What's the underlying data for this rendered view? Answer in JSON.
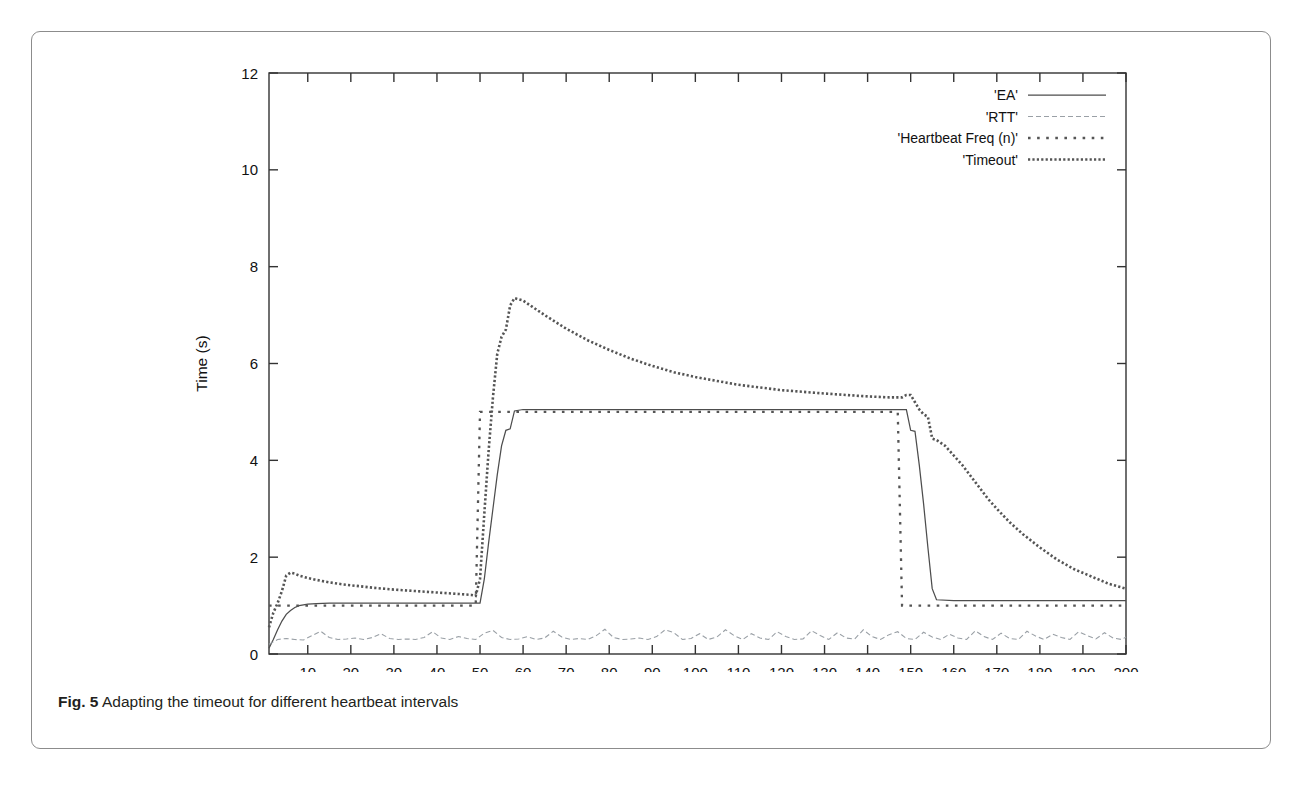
{
  "figure": {
    "caption_label": "Fig. 5",
    "caption_text": "Adapting the timeout for different heartbeat intervals"
  },
  "chart_data": {
    "type": "line",
    "title": "",
    "xlabel": "Message number",
    "ylabel": "Time (s)",
    "xlim": [
      1,
      200
    ],
    "ylim": [
      0,
      12
    ],
    "xticks": [
      10,
      20,
      30,
      40,
      50,
      60,
      70,
      80,
      90,
      100,
      110,
      120,
      130,
      140,
      150,
      160,
      170,
      180,
      190,
      200
    ],
    "yticks": [
      0,
      2,
      4,
      6,
      8,
      10,
      12
    ],
    "grid": false,
    "legend_position": "top-right",
    "series": [
      {
        "name": "'EA'",
        "style": "solid",
        "color": "#4d4d4d",
        "x": [
          1,
          2,
          3,
          4,
          5,
          6,
          7,
          8,
          10,
          12,
          15,
          20,
          25,
          30,
          35,
          40,
          45,
          48,
          49,
          50,
          51,
          52,
          53,
          54,
          55,
          56,
          57,
          58,
          60,
          70,
          80,
          90,
          100,
          110,
          120,
          130,
          140,
          147,
          148,
          149,
          150,
          151,
          152,
          153,
          154,
          155,
          156,
          160,
          170,
          180,
          190,
          200
        ],
        "values": [
          0.12,
          0.3,
          0.5,
          0.68,
          0.82,
          0.9,
          0.96,
          1.0,
          1.03,
          1.04,
          1.05,
          1.05,
          1.05,
          1.05,
          1.05,
          1.05,
          1.05,
          1.05,
          1.05,
          1.05,
          1.55,
          2.3,
          3.0,
          3.7,
          4.3,
          4.62,
          4.65,
          5.02,
          5.05,
          5.05,
          5.05,
          5.05,
          5.05,
          5.05,
          5.05,
          5.05,
          5.05,
          5.05,
          5.05,
          5.05,
          4.62,
          4.6,
          3.9,
          3.1,
          2.2,
          1.35,
          1.12,
          1.1,
          1.1,
          1.1,
          1.1,
          1.1
        ]
      },
      {
        "name": "'RTT'",
        "style": "noisy-dash",
        "color": "#9aa0a6",
        "x": [
          1,
          3,
          5,
          7,
          9,
          11,
          13,
          15,
          17,
          19,
          21,
          23,
          25,
          27,
          29,
          31,
          33,
          35,
          37,
          39,
          41,
          43,
          45,
          47,
          49,
          51,
          53,
          55,
          57,
          59,
          61,
          63,
          65,
          67,
          69,
          71,
          73,
          75,
          77,
          79,
          81,
          83,
          85,
          87,
          89,
          91,
          93,
          95,
          97,
          99,
          101,
          103,
          105,
          107,
          109,
          111,
          113,
          115,
          117,
          119,
          121,
          123,
          125,
          127,
          129,
          131,
          133,
          135,
          137,
          139,
          141,
          143,
          145,
          147,
          149,
          151,
          153,
          155,
          157,
          159,
          161,
          163,
          165,
          167,
          169,
          171,
          173,
          175,
          177,
          179,
          181,
          183,
          185,
          187,
          189,
          191,
          193,
          195,
          197,
          199,
          200
        ],
        "values": [
          0.2,
          0.3,
          0.32,
          0.3,
          0.29,
          0.38,
          0.47,
          0.34,
          0.3,
          0.31,
          0.33,
          0.3,
          0.34,
          0.42,
          0.32,
          0.3,
          0.31,
          0.3,
          0.34,
          0.46,
          0.33,
          0.3,
          0.36,
          0.32,
          0.3,
          0.43,
          0.49,
          0.34,
          0.3,
          0.31,
          0.36,
          0.3,
          0.33,
          0.47,
          0.35,
          0.3,
          0.32,
          0.3,
          0.38,
          0.51,
          0.34,
          0.3,
          0.31,
          0.33,
          0.3,
          0.36,
          0.5,
          0.44,
          0.3,
          0.32,
          0.42,
          0.3,
          0.35,
          0.5,
          0.38,
          0.3,
          0.42,
          0.33,
          0.3,
          0.46,
          0.36,
          0.3,
          0.31,
          0.48,
          0.38,
          0.3,
          0.44,
          0.33,
          0.31,
          0.5,
          0.36,
          0.3,
          0.4,
          0.46,
          0.32,
          0.3,
          0.45,
          0.35,
          0.3,
          0.41,
          0.33,
          0.3,
          0.48,
          0.36,
          0.3,
          0.43,
          0.32,
          0.3,
          0.47,
          0.37,
          0.3,
          0.41,
          0.34,
          0.3,
          0.46,
          0.38,
          0.31,
          0.44,
          0.33,
          0.3,
          0.35
        ]
      },
      {
        "name": "'Heartbeat Freq (n)'",
        "style": "dotted-sparse",
        "color": "#555555",
        "x": [
          1,
          10,
          20,
          30,
          40,
          49,
          50,
          60,
          70,
          80,
          90,
          100,
          110,
          120,
          130,
          140,
          147,
          148,
          149,
          160,
          170,
          180,
          190,
          200
        ],
        "values": [
          1.0,
          1.0,
          1.0,
          1.0,
          1.0,
          1.0,
          5.0,
          5.0,
          5.0,
          5.0,
          5.0,
          5.0,
          5.0,
          5.0,
          5.0,
          5.0,
          5.0,
          1.0,
          1.0,
          1.0,
          1.0,
          1.0,
          1.0,
          1.0
        ]
      },
      {
        "name": "'Timeout'",
        "style": "dotted-dense",
        "color": "#555555",
        "x": [
          1,
          2,
          3,
          4,
          5,
          6,
          7,
          8,
          10,
          12,
          15,
          18,
          20,
          25,
          30,
          35,
          40,
          45,
          48,
          49,
          50,
          51,
          52,
          53,
          54,
          55,
          56,
          57,
          58,
          60,
          62,
          65,
          70,
          75,
          80,
          85,
          90,
          95,
          100,
          110,
          120,
          130,
          140,
          145,
          147,
          148,
          149,
          150,
          151,
          152,
          153,
          154,
          155,
          156,
          158,
          160,
          162,
          165,
          168,
          170,
          173,
          176,
          180,
          184,
          188,
          192,
          196,
          200
        ],
        "values": [
          0.55,
          0.85,
          1.05,
          1.3,
          1.62,
          1.68,
          1.66,
          1.62,
          1.57,
          1.53,
          1.48,
          1.44,
          1.42,
          1.37,
          1.33,
          1.3,
          1.27,
          1.24,
          1.22,
          1.2,
          1.55,
          2.9,
          4.2,
          5.3,
          6.2,
          6.55,
          6.7,
          7.2,
          7.35,
          7.3,
          7.18,
          7.0,
          6.72,
          6.48,
          6.28,
          6.1,
          5.95,
          5.82,
          5.72,
          5.56,
          5.45,
          5.38,
          5.32,
          5.3,
          5.3,
          5.3,
          5.35,
          5.35,
          5.2,
          5.05,
          4.95,
          4.9,
          4.45,
          4.42,
          4.3,
          4.1,
          3.9,
          3.55,
          3.2,
          3.0,
          2.72,
          2.48,
          2.2,
          1.95,
          1.75,
          1.6,
          1.45,
          1.35
        ]
      }
    ],
    "legend": [
      {
        "label": "'EA'",
        "style": "solid"
      },
      {
        "label": "'RTT'",
        "style": "noisy-dash"
      },
      {
        "label": "'Heartbeat Freq (n)'",
        "style": "dotted-sparse"
      },
      {
        "label": "'Timeout'",
        "style": "dotted-dense"
      }
    ]
  }
}
